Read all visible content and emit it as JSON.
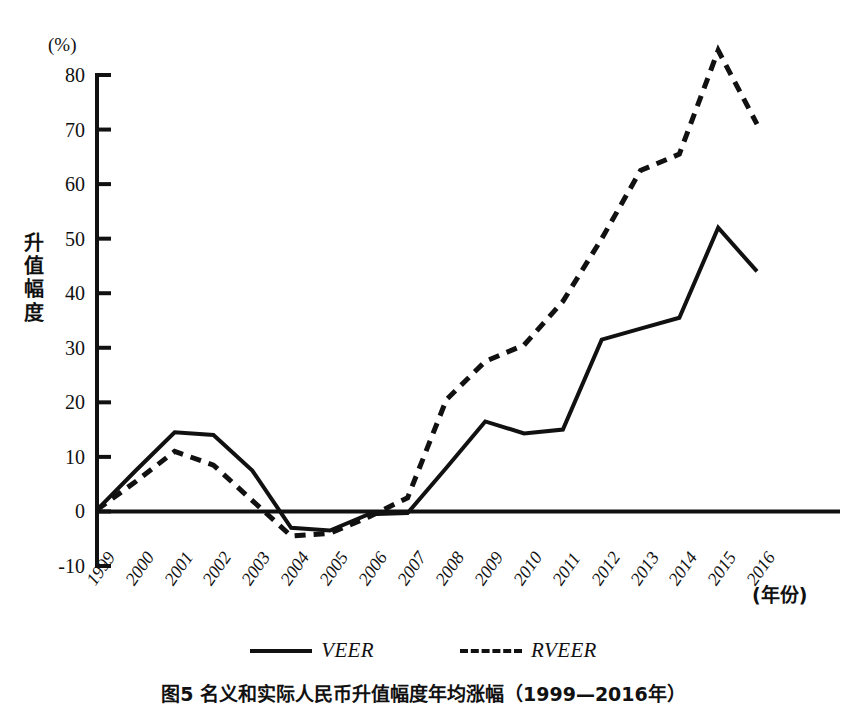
{
  "figure": {
    "caption": "图5  名义和实际人民币升值幅度年均涨幅（1999—2016年）",
    "unit_label": "(%)",
    "y_axis_title_chars": [
      "升",
      "值",
      "幅",
      "度"
    ],
    "x_axis_title": "(年份)"
  },
  "legend": {
    "entries": [
      {
        "label": "VEER",
        "style": "solid"
      },
      {
        "label": "RVEER",
        "style": "dashed"
      }
    ]
  },
  "chart_data": {
    "type": "line",
    "title": "图5  名义和实际人民币升值幅度年均涨幅（1999—2016年）",
    "xlabel": "(年份)",
    "ylabel": "升值幅度",
    "unit": "(%)",
    "ylim": [
      -10,
      80
    ],
    "ytick_labels": [
      "80",
      "70",
      "60",
      "50",
      "40",
      "30",
      "20",
      "10",
      "0",
      "-10"
    ],
    "ytick_values": [
      80,
      70,
      60,
      50,
      40,
      30,
      20,
      10,
      0,
      -10
    ],
    "grid": false,
    "legend_position": "bottom-center",
    "zero_line": true,
    "categories": [
      "1999",
      "2000",
      "2001",
      "2002",
      "2003",
      "2004",
      "2005",
      "2006",
      "2007",
      "2008",
      "2009",
      "2010",
      "2011",
      "2012",
      "2013",
      "2014",
      "2015",
      "2016"
    ],
    "series": [
      {
        "name": "VEER",
        "style": "solid",
        "color": "#111111",
        "values": [
          0.3,
          7.5,
          14.5,
          14.0,
          7.5,
          -3.0,
          -3.5,
          -0.5,
          -0.3,
          8.0,
          16.5,
          14.3,
          15.0,
          31.5,
          33.5,
          35.5,
          52.0,
          44.0
        ]
      },
      {
        "name": "RVEER",
        "style": "dashed",
        "color": "#111111",
        "values": [
          0.3,
          5.5,
          11.0,
          8.5,
          2.0,
          -4.5,
          -4.0,
          -1.0,
          2.5,
          20.5,
          27.5,
          30.5,
          38.5,
          50.0,
          62.5,
          65.5,
          84.5,
          71.0
        ]
      }
    ]
  }
}
